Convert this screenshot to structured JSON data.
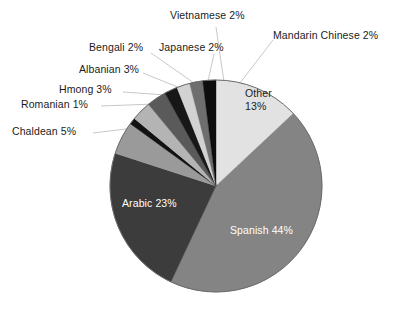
{
  "chart_data": {
    "type": "pie",
    "title": "",
    "subtitle": "",
    "xlabel": "",
    "ylabel": "",
    "legend_position": "none",
    "grid": false,
    "units": "percent",
    "start_angle_deg": 0,
    "direction": "clockwise",
    "categories": [
      "Other",
      "Spanish",
      "Arabic",
      "Chaldean",
      "Romanian",
      "Hmong",
      "Albanian",
      "Bengali",
      "Japanese",
      "Vietnamese",
      "Mandarin Chinese"
    ],
    "values": [
      13,
      44,
      23,
      5,
      1,
      3,
      3,
      2,
      2,
      2,
      2
    ],
    "slices": [
      {
        "name": "Other",
        "value": 13,
        "label": "Other",
        "value_label": "13%",
        "label_text": "Other 13%",
        "color": "#e2e2e2",
        "label_placement": "inside",
        "label_color": "#1c1c1c",
        "two_line": true
      },
      {
        "name": "Spanish",
        "value": 44,
        "label": "Spanish",
        "value_label": "44%",
        "label_text": "Spanish 44%",
        "color": "#848484",
        "label_placement": "inside",
        "label_color": "#ffffff",
        "two_line": false
      },
      {
        "name": "Arabic",
        "value": 23,
        "label": "Arabic",
        "value_label": "23%",
        "label_text": "Arabic 23%",
        "color": "#3c3c3c",
        "label_placement": "inside",
        "label_color": "#ffffff",
        "two_line": false
      },
      {
        "name": "Chaldean",
        "value": 5,
        "label": "Chaldean",
        "value_label": "5%",
        "label_text": "Chaldean 5%",
        "color": "#9a9a9a",
        "label_placement": "outside",
        "label_color": "#1c1c1c",
        "two_line": false
      },
      {
        "name": "Romanian",
        "value": 1,
        "label": "Romanian",
        "value_label": "1%",
        "label_text": "Romanian 1%",
        "color": "#121212",
        "label_placement": "outside",
        "label_color": "#1c1c1c",
        "two_line": false
      },
      {
        "name": "Hmong",
        "value": 3,
        "label": "Hmong",
        "value_label": "3%",
        "label_text": "Hmong 3%",
        "color": "#b4b4b4",
        "label_placement": "outside",
        "label_color": "#1c1c1c",
        "two_line": false
      },
      {
        "name": "Albanian",
        "value": 3,
        "label": "Albanian",
        "value_label": "3%",
        "label_text": "Albanian 3%",
        "color": "#5a5a5a",
        "label_placement": "outside",
        "label_color": "#1c1c1c",
        "two_line": false
      },
      {
        "name": "Bengali",
        "value": 2,
        "label": "Bengali",
        "value_label": "2%",
        "label_text": "Bengali 2%",
        "color": "#171717",
        "label_placement": "outside",
        "label_color": "#1c1c1c",
        "two_line": false
      },
      {
        "name": "Japanese",
        "value": 2,
        "label": "Japanese",
        "value_label": "2%",
        "label_text": "Japanese 2%",
        "color": "#d2d2d2",
        "label_placement": "outside",
        "label_color": "#1c1c1c",
        "two_line": false
      },
      {
        "name": "Vietnamese",
        "value": 2,
        "label": "Vietnamese",
        "value_label": "2%",
        "label_text": "Vietnamese 2%",
        "color": "#6e6e6e",
        "label_placement": "outside",
        "label_color": "#1c1c1c",
        "two_line": false
      },
      {
        "name": "Mandarin Chinese",
        "value": 2,
        "label": "Mandarin Chinese",
        "value_label": "2%",
        "label_text": "Mandarin Chinese 2%",
        "color": "#0d0d0d",
        "label_placement": "outside",
        "label_color": "#1c1c1c",
        "two_line": false
      }
    ]
  },
  "geometry": {
    "center_x": 216,
    "center_y": 186,
    "radius": 106,
    "outline_color": "#6a6a6a",
    "leader_color": "#c2c2c2"
  },
  "labels": {
    "vietnamese": {
      "text": "Vietnamese 2%",
      "left": 170,
      "top": 9
    },
    "mandarin_chinese": {
      "text": "Mandarin Chinese 2%",
      "left": 273,
      "top": 29
    },
    "bengali": {
      "text": "Bengali 2%",
      "left": 89,
      "top": 41
    },
    "japanese": {
      "text": "Japanese 2%",
      "left": 159,
      "top": 41
    },
    "albanian": {
      "text": "Albanian 3%",
      "left": 79,
      "top": 63
    },
    "hmong": {
      "text": "Hmong 3%",
      "left": 59,
      "top": 83
    },
    "romanian": {
      "text": "Romanian 1%",
      "left": 21,
      "top": 98
    },
    "chaldean": {
      "text": "Chaldean 5%",
      "left": 12,
      "top": 125
    },
    "other_line1": {
      "text": "Other",
      "left": 245,
      "top": 87
    },
    "other_line2": {
      "text": "13%",
      "left": 245,
      "top": 100
    },
    "arabic": {
      "text": "Arabic 23%",
      "left": 122,
      "top": 197
    },
    "spanish": {
      "text": "Spanish 44%",
      "left": 230,
      "top": 224
    }
  },
  "leader_lines": [
    {
      "name": "vietnamese-leader",
      "x1": 216,
      "y1": 27,
      "x2": 224,
      "y2": 82
    },
    {
      "name": "mandarin-leader",
      "x1": 273,
      "y1": 40,
      "x2": 240,
      "y2": 83
    },
    {
      "name": "japanese-leader",
      "x1": 214,
      "y1": 54,
      "x2": 208,
      "y2": 81
    },
    {
      "name": "bengali-leader",
      "x1": 151,
      "y1": 53,
      "x2": 194,
      "y2": 83
    },
    {
      "name": "albanian-leader",
      "x1": 143,
      "y1": 73,
      "x2": 180,
      "y2": 88
    },
    {
      "name": "hmong-leader",
      "x1": 123,
      "y1": 92,
      "x2": 166,
      "y2": 95
    },
    {
      "name": "romanian-leader",
      "x1": 101,
      "y1": 106,
      "x2": 154,
      "y2": 104
    },
    {
      "name": "chaldean-leader",
      "x1": 93,
      "y1": 133,
      "x2": 134,
      "y2": 128
    }
  ]
}
